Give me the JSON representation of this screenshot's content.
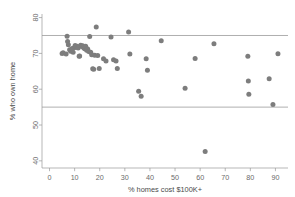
{
  "chart_data": {
    "type": "scatter",
    "title": "",
    "xlabel": "% homes cost $100K+",
    "ylabel": "% who own home",
    "xlim": [
      -3,
      95
    ],
    "ylim": [
      38,
      81
    ],
    "xticks": [
      0,
      10,
      20,
      30,
      40,
      50,
      60,
      70,
      80,
      90
    ],
    "yticks": [
      40,
      50,
      60,
      70,
      80
    ],
    "xtick_labels": [
      "0",
      "10",
      "20",
      "30",
      "40",
      "50",
      "60",
      "70",
      "80",
      "90"
    ],
    "ytick_labels": [
      "40",
      "50",
      "60",
      "70",
      "80"
    ],
    "grid": false,
    "legend": null,
    "point_color": "#7d7d7d",
    "point_radius": 2.5,
    "reference_lines": [
      {
        "orientation": "horizontal",
        "value": 75,
        "color": "#8d8d8d"
      },
      {
        "orientation": "horizontal",
        "value": 55,
        "color": "#8d8d8d"
      }
    ],
    "x": [
      5.0,
      5.4,
      6.6,
      7.0,
      7.2,
      7.5,
      8.0,
      8.4,
      9.0,
      9.4,
      9.8,
      10.2,
      10.6,
      11.0,
      11.4,
      11.8,
      12.0,
      12.4,
      12.8,
      13.2,
      13.6,
      14.0,
      14.4,
      14.8,
      15.2,
      15.6,
      16.0,
      16.4,
      16.8,
      17.2,
      17.6,
      18.0,
      18.6,
      19.2,
      19.8,
      21.5,
      22.5,
      24.5,
      25.5,
      26.5,
      27.0,
      31.5,
      32.0,
      35.5,
      36.5,
      38.5,
      39.0,
      44.5,
      54.0,
      58.0,
      62.0,
      65.5,
      79.0,
      79.2,
      79.4,
      87.5,
      89.0,
      91.0
    ],
    "y": [
      70.0,
      70.2,
      69.8,
      74.8,
      73.3,
      72.4,
      71.0,
      70.6,
      71.4,
      70.3,
      71.6,
      72.2,
      71.8,
      72.0,
      71.5,
      69.2,
      69.3,
      72.3,
      71.9,
      72.1,
      71.6,
      71.3,
      72.0,
      70.9,
      71.2,
      70.5,
      74.7,
      70.3,
      69.6,
      65.7,
      65.6,
      69.5,
      77.4,
      69.4,
      65.8,
      68.5,
      67.9,
      74.6,
      68.2,
      67.9,
      65.8,
      76.0,
      69.8,
      59.4,
      58.0,
      68.5,
      65.3,
      73.5,
      60.3,
      68.6,
      42.6,
      72.7,
      69.2,
      62.3,
      58.6,
      62.9,
      55.7,
      69.9
    ]
  }
}
